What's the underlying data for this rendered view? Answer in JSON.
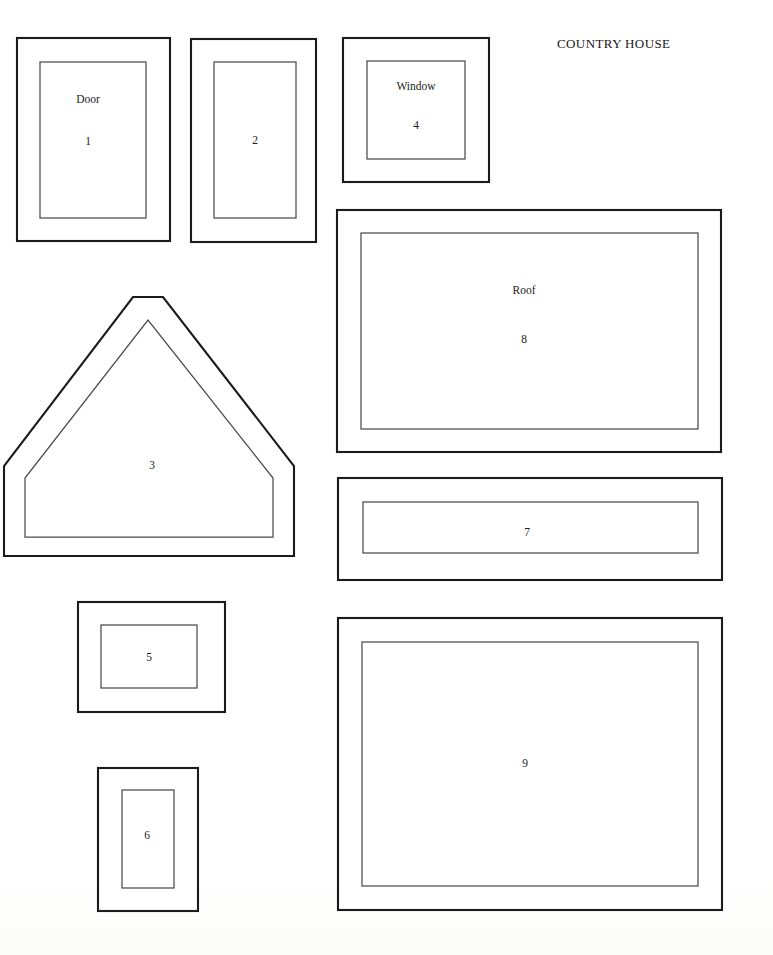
{
  "document": {
    "title": "COUNTRY HOUSE",
    "title_position": {
      "x": 557,
      "y": 36
    },
    "width": 773,
    "height": 955,
    "background_color": "#ffffff",
    "ink_color": "#1b1b1f",
    "inner_line_color": "#4a4a52"
  },
  "pieces": [
    {
      "id": "piece-1",
      "number": "1",
      "name": "Door",
      "shape": "rectangle",
      "outer": {
        "x": 17,
        "y": 38,
        "w": 153,
        "h": 203
      },
      "inner": {
        "x": 40,
        "y": 62,
        "w": 106,
        "h": 156
      },
      "name_label": {
        "x": 88,
        "y": 93
      },
      "number_label": {
        "x": 88,
        "y": 135
      }
    },
    {
      "id": "piece-2",
      "number": "2",
      "name": "",
      "shape": "rectangle",
      "outer": {
        "x": 191,
        "y": 39,
        "w": 125,
        "h": 203
      },
      "inner": {
        "x": 214,
        "y": 62,
        "w": 82,
        "h": 156
      },
      "name_label": null,
      "number_label": {
        "x": 255,
        "y": 134
      }
    },
    {
      "id": "piece-3",
      "number": "3",
      "name": "",
      "shape": "gable-pentagon",
      "outer_points": "4,466 4,556 294,556 294,466 163,297 133,297",
      "inner_points": "25,478 25,537 273,537 273,478 148,320",
      "bounds": {
        "x": 0,
        "y": 290,
        "w": 300,
        "h": 272
      },
      "name_label": null,
      "number_label": {
        "x": 152,
        "y": 459
      }
    },
    {
      "id": "piece-4",
      "number": "4",
      "name": "Window",
      "shape": "rectangle",
      "outer": {
        "x": 343,
        "y": 38,
        "w": 146,
        "h": 144
      },
      "inner": {
        "x": 367,
        "y": 61,
        "w": 98,
        "h": 98
      },
      "name_label": {
        "x": 416,
        "y": 80
      },
      "number_label": {
        "x": 416,
        "y": 119
      }
    },
    {
      "id": "piece-5",
      "number": "5",
      "name": "",
      "shape": "rectangle",
      "outer": {
        "x": 78,
        "y": 602,
        "w": 147,
        "h": 110
      },
      "inner": {
        "x": 101,
        "y": 625,
        "w": 96,
        "h": 63
      },
      "name_label": null,
      "number_label": {
        "x": 149,
        "y": 651
      }
    },
    {
      "id": "piece-6",
      "number": "6",
      "name": "",
      "shape": "rectangle",
      "outer": {
        "x": 98,
        "y": 768,
        "w": 100,
        "h": 143
      },
      "inner": {
        "x": 122,
        "y": 790,
        "w": 52,
        "h": 98
      },
      "name_label": null,
      "number_label": {
        "x": 147,
        "y": 829
      }
    },
    {
      "id": "piece-7",
      "number": "7",
      "name": "",
      "shape": "rectangle",
      "outer": {
        "x": 338,
        "y": 478,
        "w": 384,
        "h": 102
      },
      "inner": {
        "x": 363,
        "y": 502,
        "w": 335,
        "h": 51
      },
      "name_label": null,
      "number_label": {
        "x": 527,
        "y": 526
      }
    },
    {
      "id": "piece-8",
      "number": "8",
      "name": "Roof",
      "shape": "rectangle",
      "outer": {
        "x": 337,
        "y": 210,
        "w": 384,
        "h": 242
      },
      "inner": {
        "x": 361,
        "y": 233,
        "w": 337,
        "h": 196
      },
      "name_label": {
        "x": 524,
        "y": 284
      },
      "number_label": {
        "x": 524,
        "y": 333
      }
    },
    {
      "id": "piece-9",
      "number": "9",
      "name": "",
      "shape": "rectangle",
      "outer": {
        "x": 338,
        "y": 618,
        "w": 384,
        "h": 292
      },
      "inner": {
        "x": 362,
        "y": 642,
        "w": 336,
        "h": 244
      },
      "name_label": null,
      "number_label": {
        "x": 525,
        "y": 757
      }
    }
  ]
}
